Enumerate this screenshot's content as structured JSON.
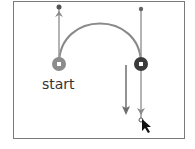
{
  "diagram": {
    "start_label": "start",
    "colors": {
      "frame": "#7a7a7a",
      "curve": "#8a8a8a",
      "handle_line": "#9a9a9a",
      "start_anchor": "#8c8c8c",
      "end_anchor": "#3a3a3a",
      "drag_arrow": "#6e6e6e",
      "cursor": "#111111"
    },
    "nodes": [
      {
        "id": "start-anchor",
        "x": 59,
        "y": 64,
        "role": "start"
      },
      {
        "id": "end-anchor",
        "x": 141,
        "y": 64,
        "role": "current"
      }
    ],
    "handles": [
      {
        "anchor": "start-anchor",
        "x": 59,
        "y": 7,
        "direction": "up"
      },
      {
        "anchor": "end-anchor",
        "x": 141,
        "y": 9,
        "direction": "down-drag",
        "end_y": 120
      }
    ],
    "drag_arrow": {
      "x": 126,
      "from_y": 65,
      "to_y": 115,
      "direction": "down"
    },
    "cursor": {
      "type": "pen-arrow",
      "x": 142,
      "y": 121
    }
  }
}
